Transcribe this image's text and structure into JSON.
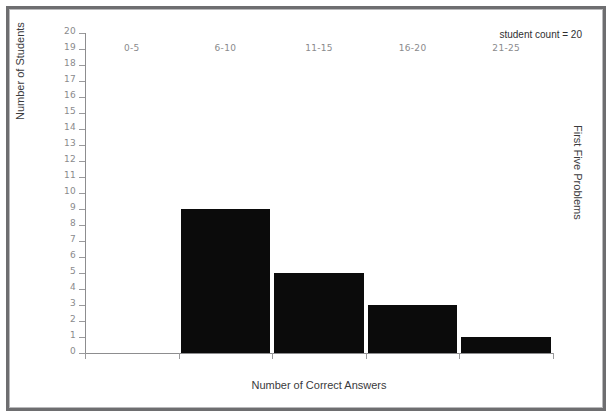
{
  "annotation": {
    "text": "student count = 20"
  },
  "right_side_label": "First Five Problems",
  "chart_data": {
    "type": "bar",
    "title": "",
    "subtitle": "",
    "xlabel": "Number of Correct Answers",
    "ylabel": "Number of Students",
    "categories": [
      "0-5",
      "6-10",
      "11-15",
      "16-20",
      "21-25"
    ],
    "values": [
      0,
      9,
      5,
      3,
      1
    ],
    "series": [
      {
        "name": "Number of Students",
        "values": [
          0,
          9,
          5,
          3,
          1
        ]
      }
    ],
    "ylim": [
      0,
      20
    ],
    "ytick_step": 1,
    "yticks": [
      0,
      1,
      2,
      3,
      4,
      5,
      6,
      7,
      8,
      9,
      10,
      11,
      12,
      13,
      14,
      15,
      16,
      17,
      18,
      19,
      20
    ],
    "ytick_labels": [
      "0",
      "1",
      "2",
      "3",
      "4",
      "5",
      "6",
      "7",
      "8",
      "9",
      "10",
      "11",
      "12",
      "13",
      "14",
      "15",
      "16",
      "17",
      "18",
      "19",
      "20"
    ],
    "grid": false,
    "legend": false,
    "legend_position": "none",
    "annotations": [
      "student count = 20",
      "First Five Problems"
    ],
    "bar_color": "#0b0b0b",
    "axis_color": "#8d8d8f",
    "tick_label_color": "#8a8a8c",
    "axis_label_color": "#3a3a3c",
    "background_color": "#ffffff",
    "frame_color": "#6e6e70"
  }
}
